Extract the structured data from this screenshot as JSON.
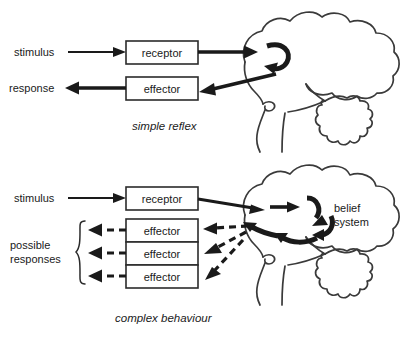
{
  "figure": {
    "background_color": "#ffffff",
    "line_color": "#1a1a1a",
    "outline_color": "#3a3a3a",
    "box_fill": "#ffffff"
  },
  "panels": [
    {
      "id": "simple-reflex",
      "caption": "simple reflex",
      "input_label": "stimulus",
      "output_label": "response",
      "boxes": [
        {
          "id": "receptor",
          "label": "receptor"
        },
        {
          "id": "effector",
          "label": "effector"
        }
      ],
      "arrows": [
        {
          "from": "stimulus",
          "to": "receptor",
          "style": "solid"
        },
        {
          "from": "receptor",
          "to": "brain",
          "style": "solid-thick"
        },
        {
          "from": "brain",
          "to": "effector",
          "style": "solid-thick"
        },
        {
          "from": "effector",
          "to": "response",
          "style": "solid-thick"
        },
        {
          "from": "brain-in",
          "to": "brain-out",
          "style": "curved-uturn"
        }
      ]
    },
    {
      "id": "complex-behaviour",
      "caption": "complex behaviour",
      "input_label": "stimulus",
      "output_label": "possible\nresponses",
      "output_label_line1": "possible",
      "output_label_line2": "responses",
      "brain_label_line1": "belief",
      "brain_label_line2": "system",
      "boxes": [
        {
          "id": "receptor",
          "label": "receptor"
        },
        {
          "id": "effector-1",
          "label": "effector"
        },
        {
          "id": "effector-2",
          "label": "effector"
        },
        {
          "id": "effector-3",
          "label": "effector"
        }
      ],
      "arrows": [
        {
          "from": "stimulus",
          "to": "receptor",
          "style": "solid"
        },
        {
          "from": "receptor",
          "to": "brain",
          "style": "solid"
        },
        {
          "from": "brain",
          "to": "effector-1",
          "style": "dashed"
        },
        {
          "from": "brain",
          "to": "effector-2",
          "style": "dashed"
        },
        {
          "from": "brain",
          "to": "effector-3",
          "style": "dashed"
        },
        {
          "from": "effector-1",
          "to": "responses",
          "style": "dashed"
        },
        {
          "from": "effector-2",
          "to": "responses",
          "style": "dashed"
        },
        {
          "from": "effector-3",
          "to": "responses",
          "style": "dashed"
        }
      ],
      "brace": {
        "id": "responses-brace",
        "orientation": "left"
      }
    }
  ]
}
